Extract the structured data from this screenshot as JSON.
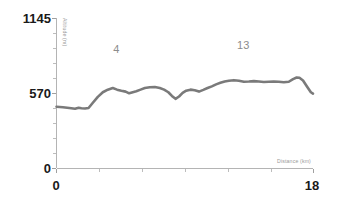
{
  "chart_data": {
    "type": "line",
    "title": "",
    "subtitle": "",
    "xlabel": "Distance (km)",
    "ylabel": "Altitude (m)",
    "xlim": [
      0,
      18
    ],
    "ylim": [
      0,
      1145
    ],
    "grid": false,
    "legend": null,
    "x_tick_labels": [
      "0",
      "18"
    ],
    "y_tick_labels": [
      "0",
      "570",
      "1145"
    ],
    "y_tick_values": [
      0,
      570,
      1145
    ],
    "x_tick_values": [
      0,
      18
    ],
    "line_color": "#7a7a7a",
    "axis_color": "#b4b4b4",
    "label_color": "#1a1a1a",
    "axis_title_color": "#9a9a9a",
    "annotation_color": "#8c8c8c",
    "series": [
      {
        "name": "Elevation profile",
        "x": [
          0.0,
          0.45,
          0.9,
          1.3,
          1.55,
          1.75,
          2.0,
          2.25,
          2.55,
          2.9,
          3.25,
          3.6,
          3.95,
          4.25,
          4.55,
          4.85,
          5.1,
          5.35,
          5.6,
          5.9,
          6.2,
          6.55,
          6.9,
          7.25,
          7.55,
          7.85,
          8.1,
          8.35,
          8.6,
          8.85,
          9.1,
          9.4,
          9.7,
          10.0,
          10.3,
          10.6,
          10.9,
          11.2,
          11.5,
          11.8,
          12.1,
          12.45,
          12.8,
          13.15,
          13.5,
          13.85,
          14.2,
          14.55,
          14.9,
          15.25,
          15.6,
          15.95,
          16.3,
          16.6,
          16.85,
          17.05,
          17.3,
          17.6,
          17.85,
          18.0
        ],
        "y": [
          470,
          466,
          460,
          455,
          462,
          458,
          457,
          460,
          500,
          545,
          580,
          600,
          612,
          600,
          592,
          585,
          572,
          580,
          588,
          600,
          612,
          618,
          620,
          612,
          600,
          580,
          552,
          530,
          548,
          575,
          592,
          600,
          595,
          585,
          598,
          612,
          625,
          640,
          652,
          662,
          668,
          672,
          668,
          660,
          662,
          665,
          662,
          658,
          660,
          662,
          660,
          656,
          660,
          680,
          692,
          690,
          670,
          620,
          580,
          570
        ],
        "color": "#7a7a7a"
      }
    ],
    "annotations": [
      {
        "label": "4",
        "x": 4.2,
        "y": 880
      },
      {
        "label": "13",
        "x": 13.1,
        "y": 910
      }
    ]
  }
}
